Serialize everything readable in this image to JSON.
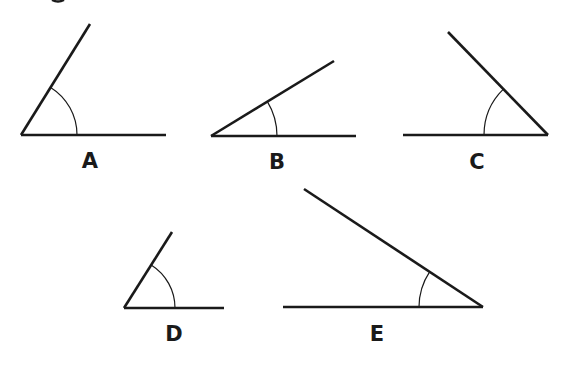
{
  "diagram": {
    "title": "",
    "stroke_color": "#1a1a1a",
    "background": "#ffffff",
    "angles": [
      {
        "label": "A",
        "vertex": [
          21,
          135
        ],
        "base_end": [
          166,
          135
        ],
        "ray_end": [
          90,
          24
        ],
        "arc_start": [
          77,
          135
        ],
        "arc_end": [
          50,
          90
        ],
        "arc_radius": 56,
        "label_pos": [
          90,
          168
        ]
      },
      {
        "label": "B",
        "vertex": [
          211,
          136
        ],
        "base_end": [
          356,
          136
        ],
        "ray_end": [
          334,
          61
        ],
        "arc_start": [
          277,
          136
        ],
        "arc_end": [
          267,
          103
        ],
        "arc_radius": 66,
        "label_pos": [
          277,
          169
        ]
      },
      {
        "label": "C",
        "vertex": [
          548,
          135
        ],
        "base_end": [
          403,
          135
        ],
        "ray_end": [
          448,
          32
        ],
        "arc_start": [
          484,
          135
        ],
        "arc_end": [
          503,
          90
        ],
        "arc_radius": 64,
        "label_pos": [
          477,
          169
        ]
      },
      {
        "label": "D",
        "vertex": [
          124,
          308
        ],
        "base_end": [
          224,
          308
        ],
        "ray_end": [
          172,
          232
        ],
        "arc_start": [
          175,
          308
        ],
        "arc_end": [
          150,
          266
        ],
        "arc_radius": 51,
        "label_pos": [
          174,
          341
        ]
      },
      {
        "label": "E",
        "vertex": [
          483,
          307
        ],
        "base_end": [
          283,
          307
        ],
        "ray_end": [
          304,
          189
        ],
        "arc_start": [
          419,
          307
        ],
        "arc_end": [
          428,
          273
        ],
        "arc_radius": 64,
        "label_pos": [
          377,
          341
        ]
      }
    ]
  }
}
